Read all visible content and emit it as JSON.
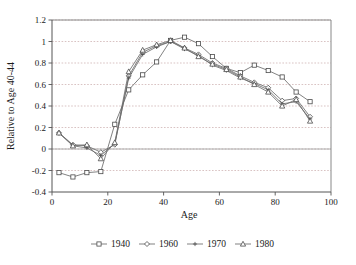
{
  "chart_data": {
    "type": "line",
    "title": "",
    "xlabel": "Age",
    "ylabel": "Relative to Age 40-44",
    "xlim": [
      0,
      100
    ],
    "ylim": [
      -0.4,
      1.2
    ],
    "xticks": [
      0,
      20,
      40,
      60,
      80,
      100
    ],
    "yticks": [
      -0.4,
      -0.2,
      0,
      0.2,
      0.4,
      0.6,
      0.8,
      1,
      1.2
    ],
    "xtick_labels": [
      "0",
      "20",
      "40",
      "60",
      "80",
      "100"
    ],
    "ytick_labels": [
      "-0.4",
      "-0.2",
      "0",
      "0.2",
      "0.4",
      "0.6",
      "0.8",
      "1",
      "1.2"
    ],
    "grid": true,
    "grid_axis": "y",
    "legend_position": "bottom",
    "x": [
      2.5,
      7.5,
      12.5,
      17.5,
      22.5,
      27.5,
      32.5,
      37.5,
      42.5,
      47.5,
      52.5,
      57.5,
      62.5,
      67.5,
      72.5,
      77.5,
      82.5,
      87.5,
      92.5
    ],
    "series": [
      {
        "name": "1940",
        "marker": "square",
        "values": [
          -0.22,
          -0.26,
          -0.22,
          -0.21,
          0.23,
          0.55,
          0.69,
          0.81,
          1.01,
          1.04,
          0.98,
          0.86,
          0.75,
          0.71,
          0.78,
          0.73,
          0.67,
          0.53,
          0.44
        ]
      },
      {
        "name": "1960",
        "marker": "diamond",
        "values": [
          0.15,
          0.04,
          0.03,
          -0.03,
          0.04,
          0.68,
          0.9,
          0.96,
          1.0,
          0.94,
          0.88,
          0.8,
          0.75,
          0.68,
          0.62,
          0.57,
          0.45,
          0.47,
          0.3
        ]
      },
      {
        "name": "1970",
        "marker": "cross",
        "values": [
          0.15,
          0.03,
          0.01,
          -0.06,
          0.05,
          0.66,
          0.88,
          0.95,
          1.0,
          0.93,
          0.87,
          0.78,
          0.73,
          0.66,
          0.61,
          0.55,
          0.42,
          0.44,
          0.28
        ]
      },
      {
        "name": "1980",
        "marker": "triangle",
        "values": [
          0.15,
          0.03,
          0.04,
          -0.09,
          0.06,
          0.72,
          0.92,
          0.97,
          1.01,
          0.94,
          0.86,
          0.79,
          0.74,
          0.67,
          0.6,
          0.53,
          0.4,
          0.46,
          0.26
        ]
      }
    ]
  }
}
